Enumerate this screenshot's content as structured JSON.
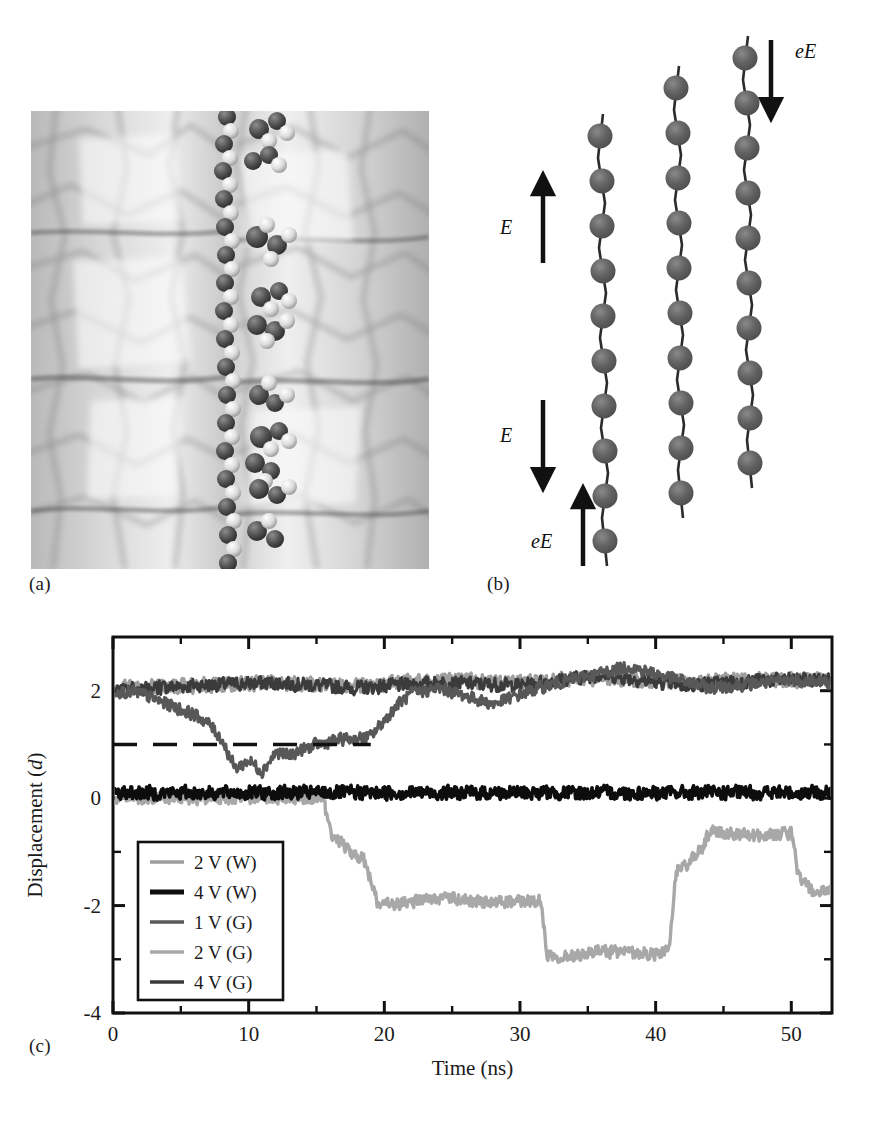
{
  "figure": {
    "panels": [
      {
        "id": "a",
        "label": "(a)",
        "kind": "simulation-snapshot",
        "description": "grayscale molecular dynamics snapshot of a polymer chain threaded between two solid walls"
      },
      {
        "id": "b",
        "label": "(b)",
        "kind": "schematic",
        "description": "three vertical bead-spring chains with field arrows"
      },
      {
        "id": "c",
        "label": "(c)",
        "kind": "line-chart"
      }
    ]
  },
  "panel_b": {
    "labels": [
      {
        "name": "field-up",
        "text": "E",
        "direction": "up"
      },
      {
        "name": "field-down",
        "text": "E",
        "direction": "down"
      },
      {
        "name": "force-up",
        "text": "eE",
        "direction": "up"
      },
      {
        "name": "force-down",
        "text": "eE",
        "direction": "down"
      }
    ],
    "chains": [
      {
        "name": "chain-left",
        "beads": 10
      },
      {
        "name": "chain-middle",
        "beads": 10
      },
      {
        "name": "chain-right",
        "beads": 10
      }
    ],
    "bead_color": "#5a5a5a",
    "line_color": "#2b2b2b"
  },
  "chart_data": {
    "type": "line",
    "title": "",
    "xlabel": "Time (ns)",
    "ylabel": "Displacement (d)",
    "xlim": [
      0,
      53
    ],
    "ylim": [
      -4,
      3
    ],
    "xticks": [
      0,
      10,
      20,
      30,
      40,
      50
    ],
    "xtick_labels": [
      "0",
      "10",
      "20",
      "30",
      "40",
      "50"
    ],
    "xminor": [
      5,
      15,
      25,
      35,
      45
    ],
    "yticks": [
      2,
      0,
      -2,
      -4
    ],
    "ytick_labels": [
      "2",
      "0",
      "-2",
      "-4"
    ],
    "yminor": [
      1,
      -1,
      -3
    ],
    "grid": false,
    "legend_position": "lower-left-inside",
    "reference_line": {
      "y": 1,
      "style": "dashed",
      "x_from": 0,
      "x_to": 19,
      "color": "#111111"
    },
    "series": [
      {
        "name": "2 V (W)",
        "label": "2 V (W)",
        "color": "#9e9e9e",
        "baseline": 2.15,
        "x": [
          0,
          6,
          12,
          18,
          24,
          30,
          36,
          42,
          48,
          53
        ],
        "values": [
          2.05,
          2.1,
          2.15,
          2.1,
          2.2,
          2.15,
          2.25,
          2.15,
          2.2,
          2.2
        ]
      },
      {
        "name": "4 V (W)",
        "label": "4 V (W)",
        "color": "#0d0d0d",
        "baseline": 0.1,
        "x": [
          0,
          6,
          12,
          18,
          24,
          30,
          36,
          42,
          48,
          53
        ],
        "values": [
          0.1,
          0.1,
          0.1,
          0.1,
          0.1,
          0.1,
          0.1,
          0.1,
          0.1,
          0.1
        ]
      },
      {
        "name": "1 V (G)",
        "label": "1 V (G)",
        "color": "#585858",
        "baseline": 2.1,
        "x": [
          0,
          2,
          4,
          6,
          7,
          8,
          9,
          10,
          11,
          12,
          13,
          14,
          15,
          16,
          17,
          18,
          19,
          20,
          21,
          22,
          24,
          28,
          32,
          38,
          44,
          50,
          53
        ],
        "values": [
          2.0,
          1.95,
          1.75,
          1.55,
          1.4,
          1.1,
          0.55,
          0.7,
          0.5,
          0.85,
          0.8,
          0.9,
          1.0,
          1.05,
          1.1,
          1.1,
          1.15,
          1.45,
          1.75,
          1.95,
          2.05,
          1.75,
          2.1,
          2.45,
          2.05,
          2.2,
          2.15
        ]
      },
      {
        "name": "2 V (G)",
        "label": "2 V (G)",
        "color": "#a8a8a8",
        "baseline": -2.0,
        "x": [
          0,
          15.5,
          16,
          16.5,
          17.5,
          18.5,
          19.5,
          20.5,
          24,
          28,
          31.5,
          32,
          33,
          36,
          40,
          41,
          41.5,
          42.5,
          43.5,
          44,
          47,
          50,
          50.5,
          51.5,
          53
        ],
        "values": [
          0.0,
          0.0,
          -0.65,
          -0.75,
          -1.0,
          -1.15,
          -1.95,
          -2.0,
          -1.85,
          -1.95,
          -1.9,
          -2.9,
          -2.95,
          -2.85,
          -2.9,
          -2.85,
          -1.35,
          -1.2,
          -0.9,
          -0.6,
          -0.7,
          -0.65,
          -1.4,
          -1.75,
          -1.75
        ]
      },
      {
        "name": "4 V (G)",
        "label": "4 V (G)",
        "color": "#3b3b3b",
        "baseline": 2.15,
        "x": [
          0,
          6,
          12,
          18,
          24,
          30,
          36,
          42,
          48,
          53
        ],
        "values": [
          2.0,
          2.1,
          2.15,
          2.05,
          2.15,
          2.1,
          2.3,
          2.1,
          2.2,
          2.2
        ]
      }
    ]
  }
}
